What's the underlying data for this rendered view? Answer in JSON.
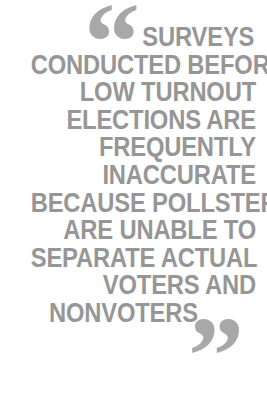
{
  "graphic": {
    "type": "pull-quote",
    "background_color": "#ffffff",
    "text_color": "#969696",
    "quote_mark_color": "#a8a8a8",
    "alignment": "right",
    "case": "uppercase",
    "open_quote_glyph": "“",
    "close_quote_glyph": "”",
    "full_text": "SURVEYS CONDUCTED BEFORE LOW TURNOUT ELECTIONS ARE FREQUENTLY INACCURATE BECAUSE POLLSTERS ARE UNABLE TO SEPARATE ACTUAL VOTERS AND NONVOTERS",
    "lines": [
      "SURVEYS",
      "CONDUCTED BEFORE",
      "LOW TURNOUT",
      "ELECTIONS ARE",
      "FREQUENTLY",
      "INACCURATE",
      "BECAUSE POLLSTERS",
      "ARE UNABLE TO",
      "SEPARATE ACTUAL",
      "VOTERS AND",
      "NONVOTERS"
    ]
  }
}
